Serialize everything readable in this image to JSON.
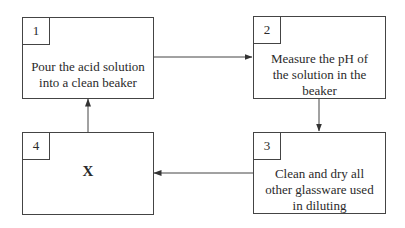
{
  "diagram": {
    "type": "cycle-flowchart",
    "steps": [
      {
        "number": "1",
        "text": "Pour the acid solution into a clean beaker"
      },
      {
        "number": "2",
        "text": "Measure the pH of the solution in the beaker"
      },
      {
        "number": "3",
        "text": "Clean and dry all other glassware used in diluting"
      },
      {
        "number": "4",
        "text": "X"
      }
    ],
    "connections": [
      {
        "from": "1",
        "to": "2"
      },
      {
        "from": "2",
        "to": "3"
      },
      {
        "from": "3",
        "to": "4"
      },
      {
        "from": "4",
        "to": "1"
      }
    ],
    "colors": {
      "line": "#444444",
      "text": "#2a2a2a",
      "background": "#ffffff"
    }
  }
}
